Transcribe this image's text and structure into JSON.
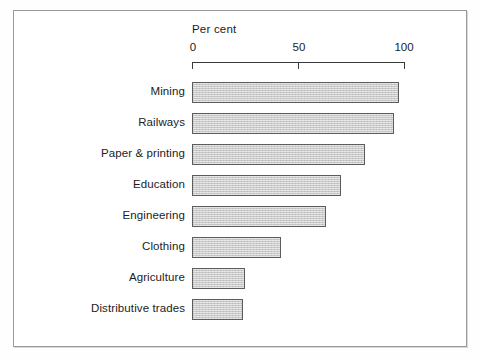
{
  "figure": {
    "axis_title": "Per cent",
    "frame_color": "#9a9a9a",
    "bar_fill_color": "#c9c9c9",
    "bar_border_color": "#5c5c5c",
    "text_color": "#1c1c1c"
  },
  "chart_data": {
    "type": "bar",
    "orientation": "horizontal",
    "title": "",
    "subtitle": "",
    "xlabel": "Per cent",
    "ylabel": "",
    "xlim": [
      0,
      100
    ],
    "xticks": [
      0,
      50,
      100
    ],
    "xticklabels": [
      "0",
      "50",
      "100"
    ],
    "grid": false,
    "legend": null,
    "annotations": [],
    "categories": [
      "Mining",
      "Railways",
      "Paper & printing",
      "Education",
      "Engineering",
      "Clothing",
      "Agriculture",
      "Distributive trades"
    ],
    "values": [
      97,
      95,
      81,
      70,
      63,
      42,
      25,
      24
    ],
    "bars": [
      {
        "label": "Mining",
        "value": 97
      },
      {
        "label": "Railways",
        "value": 95
      },
      {
        "label": "Paper & printing",
        "value": 81
      },
      {
        "label": "Education",
        "value": 70
      },
      {
        "label": "Engineering",
        "value": 63
      },
      {
        "label": "Clothing",
        "value": 42
      },
      {
        "label": "Agriculture",
        "value": 25
      },
      {
        "label": "Distributive trades",
        "value": 24
      }
    ]
  }
}
